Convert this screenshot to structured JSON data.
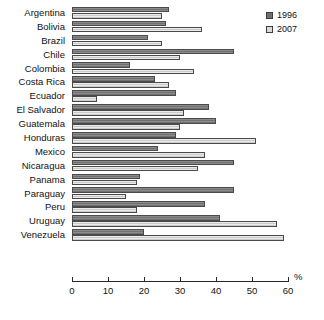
{
  "chart_data": {
    "type": "bar",
    "orientation": "horizontal",
    "title": "",
    "subtitle": "",
    "xlabel": "%",
    "ylabel": "",
    "xlim": [
      0,
      60
    ],
    "xticks": [
      0,
      10,
      20,
      30,
      40,
      50,
      60
    ],
    "grid": false,
    "legend_position": "top-right",
    "categories": [
      "Argentina",
      "Bolivia",
      "Brazil",
      "Chile",
      "Colombia",
      "Costa Rica",
      "Ecuador",
      "El Salvador",
      "Guatemala",
      "Honduras",
      "Mexico",
      "Nicaragua",
      "Panama",
      "Paraguay",
      "Peru",
      "Uruguay",
      "Venezuela"
    ],
    "series": [
      {
        "name": "1996",
        "color": "#787878",
        "values": [
          27,
          26,
          21,
          45,
          16,
          23,
          29,
          38,
          40,
          29,
          24,
          45,
          19,
          45,
          37,
          41,
          20
        ]
      },
      {
        "name": "2007",
        "color": "#d6d6d6",
        "values": [
          25,
          36,
          25,
          30,
          34,
          27,
          7,
          31,
          30,
          51,
          37,
          35,
          18,
          15,
          18,
          57,
          59
        ]
      }
    ]
  },
  "legend": {
    "items": [
      {
        "label": "1996",
        "swatch": "dark-gray"
      },
      {
        "label": "2007",
        "swatch": "light-gray"
      }
    ]
  },
  "axis": {
    "unit_label": "%",
    "tick_labels": [
      "0",
      "10",
      "20",
      "30",
      "40",
      "50",
      "60"
    ]
  }
}
